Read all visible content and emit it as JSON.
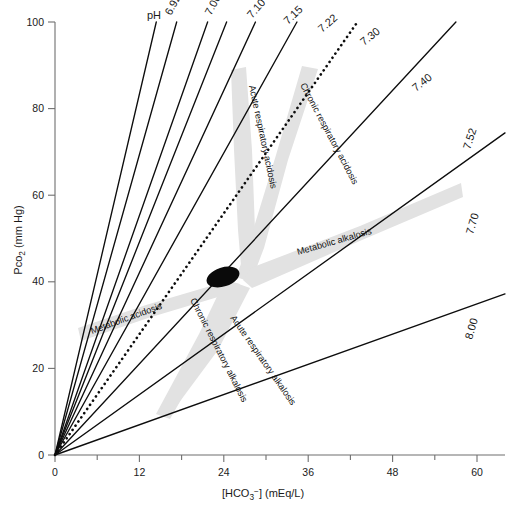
{
  "figure": {
    "background_color": "#ffffff",
    "line_color": "#0d0d0d",
    "band_color": "#e2e2e2",
    "axis_color": "#6f6f6f"
  },
  "axes": {
    "x": {
      "label_text": "[HCO",
      "label_sub": "3",
      "label_sup": "−",
      "label_tail": "] (mEq/L)",
      "label_full": "[HCO3-] (mEq/L)",
      "ticks": [
        "0",
        "12",
        "24",
        "36",
        "48",
        "60"
      ],
      "tick_values": [
        0,
        12,
        24,
        36,
        48,
        60
      ],
      "range": [
        0,
        64
      ]
    },
    "y": {
      "label_text": "Pco",
      "label_sub": "2",
      "label_tail": " (mm Hg)",
      "label_full": "Pco2 (mm Hg)",
      "ticks": [
        "0",
        "20",
        "40",
        "60",
        "80",
        "100"
      ],
      "tick_values": [
        0,
        20,
        40,
        60,
        80,
        100
      ],
      "range": [
        0,
        100
      ]
    }
  },
  "ph_prefix_label": "pH",
  "ph_lines": [
    {
      "label": "6.92",
      "style": "solid",
      "x_at_100": 14.4,
      "label_x": 171,
      "label_y": 16,
      "rotate": -62
    },
    {
      "label": "7.00",
      "style": "solid",
      "x_at_100": 17.3,
      "label_x": 211,
      "label_y": 16,
      "rotate": -62
    },
    {
      "label": "7.10",
      "style": "solid",
      "x_at_100": 21.7,
      "label_x": 252,
      "label_y": 19,
      "rotate": -49
    },
    {
      "label": "7.15",
      "style": "solid",
      "x_at_100": 24.4,
      "label_x": 288,
      "label_y": 25,
      "rotate": -44
    },
    {
      "label": "7.22",
      "style": "solid",
      "x_at_100": 28.5,
      "label_x": 322,
      "label_y": 33,
      "rotate": -41
    },
    {
      "label": "7.30",
      "style": "solid",
      "x_at_100": 34.4,
      "label_x": 364,
      "label_y": 46,
      "rotate": -39
    },
    {
      "label": "7.40",
      "style": "dotted",
      "x_at_100": 43.0,
      "label_x": 416,
      "label_y": 92,
      "rotate": -39
    },
    {
      "label": "7.52",
      "style": "solid",
      "x_at_100": 57.0,
      "label_x": 470,
      "label_y": 150,
      "rotate": -72
    },
    {
      "label": "7.70",
      "style": "solid",
      "x_at_100": 86.0,
      "label_x": 473,
      "label_y": 235,
      "rotate": -74
    },
    {
      "label": "8.00",
      "style": "solid",
      "x_at_100": 172.0,
      "label_x": 472,
      "label_y": 340,
      "rotate": -74
    }
  ],
  "bands": [
    {
      "name": "acute-respiratory-acidosis",
      "label": "Acute respiratory acidosis",
      "label_x": 249,
      "label_y": 86,
      "rotate": 78,
      "points": "231,70 246,67 252,150 255,230 258,276 242,278 238,230 234,150"
    },
    {
      "name": "chronic-respiratory-acidosis",
      "label": "Chronic respiratory acidosis",
      "label_x": 300,
      "label_y": 85,
      "rotate": 62,
      "points": "302,66 318,69 288,160 264,248 251,282 236,277 250,240 276,155"
    },
    {
      "name": "metabolic-alkalosis",
      "label": "Metabolic alkalosis",
      "label_x": 298,
      "label_y": 255,
      "rotate": -16,
      "points": "243,280 251,268 360,226 461,183 463,197 362,240 252,288"
    },
    {
      "name": "metabolic-acidosis",
      "label": "Metabolic acidosis",
      "label_x": 92,
      "label_y": 334,
      "rotate": -20,
      "points": "231,280 238,291 148,318 81,341 78,328 146,305"
    },
    {
      "name": "chronic-respiratory-alkalosis",
      "label": "Chronic respiratory alkalosis",
      "label_x": 190,
      "label_y": 300,
      "rotate": 63,
      "points": "225,280 240,284 212,340 182,398 170,419 156,414 170,388 199,334"
    },
    {
      "name": "acute-respiratory-alkalosis",
      "label": "Acute respiratory alkalosis",
      "label_x": 230,
      "label_y": 318,
      "rotate": 55,
      "points": "236,283 250,288 218,350 178,404 164,400 200,345"
    }
  ],
  "normal_point": {
    "name": "normal-range-ellipse",
    "cx": 223,
    "cy": 277,
    "rx": 17,
    "ry": 9.5,
    "rotate": -18
  }
}
